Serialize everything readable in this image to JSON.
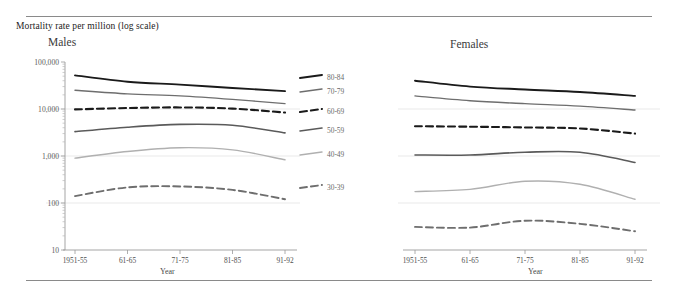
{
  "figure": {
    "axis_title": "Mortality rate per million (log scale)",
    "panels": [
      {
        "key": "males",
        "title": "Males",
        "xlabel": "Year"
      },
      {
        "key": "females",
        "title": "Females",
        "xlabel": "Year"
      }
    ]
  },
  "chart_data": {
    "type": "line",
    "title": "Mortality rate per million (log scale)",
    "xlabel": "Year",
    "ylabel": "Mortality rate per million (log scale)",
    "yscale": "log",
    "ylim": [
      10,
      100000
    ],
    "ytick_labels": [
      "100,000",
      "10,000",
      "1,000",
      "100",
      "10"
    ],
    "ytick_values": [
      100000,
      10000,
      1000,
      100,
      10
    ],
    "grid": true,
    "legend_position": "right-of-plot",
    "categories": [
      "1951-55",
      "61-65",
      "71-75",
      "81-85",
      "91-92"
    ],
    "x": [
      "1951-55",
      "61-65",
      "71-75",
      "81-85",
      "91-92"
    ],
    "panels": [
      {
        "name": "Males",
        "series": [
          {
            "name": "80-84",
            "style": "solid",
            "color": "#1a1a1a",
            "width": 1.9,
            "values": [
              52000,
              38000,
              33000,
              28000,
              24000
            ]
          },
          {
            "name": "70-79",
            "style": "solid",
            "color": "#6e6e6e",
            "width": 1.4,
            "values": [
              25000,
              21000,
              19000,
              16000,
              13000
            ]
          },
          {
            "name": "60-69",
            "style": "dashed",
            "color": "#1a1a1a",
            "width": 2.1,
            "values": [
              9800,
              10500,
              10800,
              10200,
              8400
            ]
          },
          {
            "name": "50-59",
            "style": "solid",
            "color": "#5a5a5a",
            "width": 1.6,
            "values": [
              3300,
              4100,
              4700,
              4500,
              3100
            ]
          },
          {
            "name": "40-49",
            "style": "solid",
            "color": "#b0b0b0",
            "width": 1.4,
            "values": [
              900,
              1250,
              1500,
              1350,
              830
            ]
          },
          {
            "name": "30-39",
            "style": "dashed",
            "color": "#6e6e6e",
            "width": 1.9,
            "values": [
              140,
              215,
              225,
              190,
              120
            ]
          }
        ]
      },
      {
        "name": "Females",
        "series": [
          {
            "name": "80-84",
            "style": "solid",
            "color": "#1a1a1a",
            "width": 1.9,
            "values": [
              40000,
              30000,
              26000,
              23000,
              19000
            ]
          },
          {
            "name": "70-79",
            "style": "solid",
            "color": "#6e6e6e",
            "width": 1.4,
            "values": [
              19000,
              15000,
              13000,
              11500,
              9500
            ]
          },
          {
            "name": "60-69",
            "style": "dashed",
            "color": "#1a1a1a",
            "width": 2.1,
            "values": [
              4300,
              4200,
              4050,
              3850,
              3000
            ]
          },
          {
            "name": "50-59",
            "style": "solid",
            "color": "#5a5a5a",
            "width": 1.6,
            "values": [
              1050,
              1050,
              1200,
              1200,
              730
            ]
          },
          {
            "name": "40-49",
            "style": "solid",
            "color": "#b0b0b0",
            "width": 1.4,
            "values": [
              175,
              195,
              290,
              250,
              120
            ]
          },
          {
            "name": "30-39",
            "style": "dashed",
            "color": "#6e6e6e",
            "width": 1.9,
            "values": [
              31,
              30,
              42,
              36,
              25
            ]
          }
        ]
      }
    ],
    "legend_entries": [
      "80-84",
      "70-79",
      "60-69",
      "50-59",
      "40-49",
      "30-39"
    ]
  },
  "layout": {
    "plot_top": 62,
    "plot_bottom": 250,
    "males_x0": 75,
    "males_x1": 285,
    "females_x0": 415,
    "females_x1": 635,
    "legend_x": 300,
    "legend_y": [
      78,
      92,
      112,
      131,
      155,
      188
    ]
  }
}
